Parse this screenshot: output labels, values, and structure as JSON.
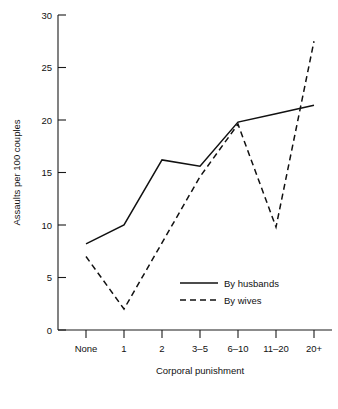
{
  "chart_data": {
    "type": "line",
    "title": "",
    "xlabel": "Corporal punishment",
    "ylabel": "Assaults per 100 couples",
    "categories": [
      "None",
      "1",
      "2",
      "3–5",
      "6–10",
      "11–20",
      "20+"
    ],
    "ylim": [
      0,
      30
    ],
    "yticks": [
      0,
      5,
      10,
      15,
      20,
      25,
      30
    ],
    "ytick_labels": [
      "0",
      "5",
      "10",
      "15",
      "20",
      "25",
      "30"
    ],
    "grid": false,
    "legend_position": "center-right-inside",
    "series": [
      {
        "name": "By husbands",
        "style": "solid",
        "values": [
          8.2,
          10.0,
          16.2,
          15.6,
          19.8,
          20.6,
          21.4
        ]
      },
      {
        "name": "By wives",
        "style": "dashed",
        "values": [
          7.0,
          2.0,
          8.3,
          14.6,
          19.6,
          9.8,
          27.5
        ]
      }
    ],
    "legend": [
      {
        "label": "By husbands",
        "style": "solid"
      },
      {
        "label": "By wives",
        "style": "dashed"
      }
    ],
    "colors": {
      "line": "#111111",
      "background": "#ffffff"
    }
  }
}
